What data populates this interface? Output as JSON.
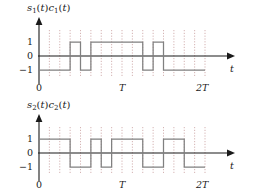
{
  "figure": {
    "background_color": "#ffffff",
    "trace_color": "#808080",
    "axis_color": "#1a1a1a",
    "grid_color": "#c9a0a0"
  },
  "panels": [
    {
      "id": "top",
      "title": "s1(t)c1(t)",
      "title_parts": {
        "s": "s",
        "s_sub": "1",
        "mid": "(t)",
        "c": "c",
        "c_sub": "1",
        "end": "(t)"
      },
      "y_labels": [
        "1",
        "0",
        "−1"
      ],
      "x_tick_labels": [
        "0",
        "T",
        "2T"
      ],
      "x_axis_name": "t"
    },
    {
      "id": "bottom",
      "title": "s2(t)c2(t)",
      "title_parts": {
        "s": "s",
        "s_sub": "2",
        "mid": "(t)",
        "c": "c",
        "c_sub": "2",
        "end": "(t)"
      },
      "y_labels": [
        "1",
        "0",
        "−1"
      ],
      "x_tick_labels": [
        "0",
        "T",
        "2T"
      ],
      "x_axis_name": "t"
    }
  ],
  "chart_data": [
    {
      "type": "line",
      "title": "s1(t)c1(t)",
      "subtitle": "",
      "xlabel": "t",
      "ylabel": "",
      "ylim": [
        -1.6,
        1.6
      ],
      "xlim": [
        0,
        2
      ],
      "grid": true,
      "grid_axis": "x",
      "legend_position": "none",
      "waveform_style": "square-bipolar",
      "chips_per_symbol": 8,
      "symbol_duration": "T",
      "x_tick_values": [
        0,
        1,
        2
      ],
      "x_tick_labels": [
        "0",
        "T",
        "2T"
      ],
      "y_tick_values": [
        -1,
        0,
        1
      ],
      "y_tick_labels": [
        "−1",
        "0",
        "1"
      ],
      "chip_values": [
        -1,
        -1,
        -1,
        1,
        -1,
        1,
        1,
        1,
        1,
        1,
        -1,
        1,
        -1,
        -1,
        -1,
        -1
      ],
      "x": [
        0,
        0.125,
        0.25,
        0.375,
        0.5,
        0.625,
        0.75,
        0.875,
        1.0,
        1.125,
        1.25,
        1.375,
        1.5,
        1.625,
        1.75,
        1.875
      ],
      "annotations": []
    },
    {
      "type": "line",
      "title": "s2(t)c2(t)",
      "subtitle": "",
      "xlabel": "t",
      "ylabel": "",
      "ylim": [
        -1.6,
        1.6
      ],
      "xlim": [
        0,
        2
      ],
      "grid": true,
      "grid_axis": "x",
      "legend_position": "none",
      "waveform_style": "square-bipolar",
      "chips_per_symbol": 8,
      "symbol_duration": "T",
      "x_tick_values": [
        0,
        1,
        2
      ],
      "x_tick_labels": [
        "0",
        "T",
        "2T"
      ],
      "y_tick_values": [
        -1,
        0,
        1
      ],
      "y_tick_labels": [
        "−1",
        "0",
        "1"
      ],
      "chip_values": [
        1,
        1,
        1,
        -1,
        -1,
        1,
        -1,
        1,
        1,
        1,
        -1,
        -1,
        1,
        1,
        -1,
        -1
      ],
      "x": [
        0,
        0.125,
        0.25,
        0.375,
        0.5,
        0.625,
        0.75,
        0.875,
        1.0,
        1.125,
        1.25,
        1.375,
        1.5,
        1.625,
        1.75,
        1.875
      ],
      "annotations": []
    }
  ]
}
